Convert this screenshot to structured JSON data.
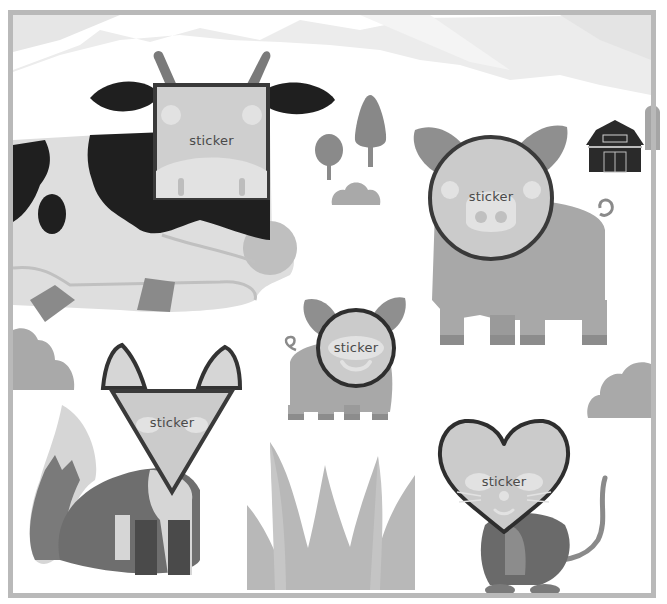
{
  "scene": {
    "description": "farm sticker placement board",
    "colors": {
      "frame": "#b9b9b9",
      "sky_mountain": "#e9e9e9",
      "sticker_fill": "#cfcfcf",
      "sticker_stroke": "#3a3a3a",
      "sticker_text": "#4a4a4a",
      "cow_black": "#1f1f1f",
      "cow_white": "#dedede",
      "pig": "#a8a8a8",
      "pig_ear": "#8f8f8f",
      "fox_dark": "#6e6e6e",
      "fox_light": "#d6d6d6",
      "mouse": "#6a6a6a",
      "grass": "#b5b5b5",
      "tree": "#8a8a8a",
      "barn": "#2a2a2a",
      "bush": "#a9a9a9"
    }
  },
  "stickers": [
    {
      "id": "square",
      "shape": "square",
      "label": "sticker",
      "on_animal": "cow",
      "x": 153,
      "y": 83,
      "w": 117,
      "h": 117
    },
    {
      "id": "circle-large",
      "shape": "circle",
      "label": "sticker",
      "on_animal": "big-pig",
      "x": 428,
      "y": 135,
      "w": 126,
      "h": 126
    },
    {
      "id": "circle-small",
      "shape": "circle",
      "label": "sticker",
      "on_animal": "small-pig",
      "x": 316,
      "y": 308,
      "w": 80,
      "h": 80
    },
    {
      "id": "triangle",
      "shape": "triangle",
      "label": "sticker",
      "on_animal": "fox",
      "x": 110,
      "y": 389,
      "w": 124,
      "h": 105
    },
    {
      "id": "heart",
      "shape": "heart",
      "label": "sticker",
      "on_animal": "mouse",
      "x": 437,
      "y": 418,
      "w": 134,
      "h": 116
    }
  ],
  "animals": [
    "cow",
    "big-pig",
    "small-pig",
    "fox",
    "mouse"
  ],
  "decor": [
    "mountains",
    "trees",
    "bush",
    "barn",
    "grass",
    "clouds-left",
    "cloud-right"
  ]
}
